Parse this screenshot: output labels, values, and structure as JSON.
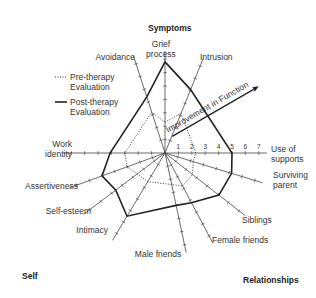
{
  "chart_data": {
    "type": "radar",
    "title": "",
    "section_labels": {
      "top": "Symptoms",
      "bottom_left": "Self",
      "bottom_right": "Relationships"
    },
    "annotation": "Improvement in Function",
    "scale": {
      "min": 0,
      "max": 7,
      "tick_labels": [
        "1",
        "2",
        "3",
        "4",
        "5",
        "6",
        "7"
      ]
    },
    "axes": [
      "Grief process",
      "Intrusion",
      "Use of supports",
      "Surviving parent",
      "Siblings",
      "Female friends",
      "Male friends",
      "Intimacy",
      "Self-esteem",
      "Assertiveness",
      "Work identity",
      "Avoidance"
    ],
    "series": [
      {
        "name": "Pre-therapy Evaluation",
        "style": "dotted",
        "values": [
          2.3,
          3.2,
          2.3,
          2.2,
          2.6,
          2.8,
          2.4,
          2.5,
          2.6,
          3.0,
          3.0,
          3.2
        ]
      },
      {
        "name": "Post-therapy Evaluation",
        "style": "solid",
        "values": [
          6.8,
          5.1,
          5.0,
          5.2,
          5.1,
          4.2,
          4.0,
          5.5,
          4.6,
          5.0,
          4.1,
          4.4
        ]
      }
    ],
    "legend": [
      {
        "label": "Pre-therapy Evaluation",
        "style": "dotted"
      },
      {
        "label": "Post-therapy Evaluation",
        "style": "solid"
      }
    ],
    "legend_position": "top-left"
  }
}
